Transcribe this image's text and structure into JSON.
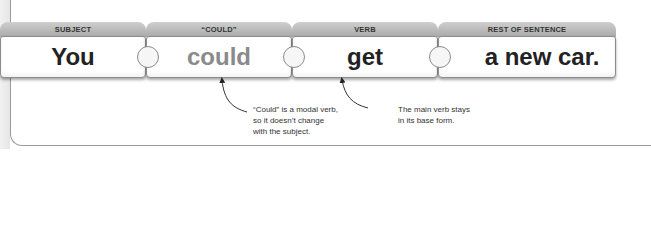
{
  "blocks": [
    {
      "header": "SUBJECT",
      "word": "You",
      "style": "normal"
    },
    {
      "header": "“COULD”",
      "word": "could",
      "style": "gray"
    },
    {
      "header": "VERB",
      "word": "get",
      "style": "normal"
    },
    {
      "header": "REST OF SENTENCE",
      "word": "a new car.",
      "style": "normal"
    }
  ],
  "annotations": [
    {
      "target": "could",
      "lines": [
        "“Could” is a modal verb,",
        "so it doesn’t change",
        "with the subject."
      ]
    },
    {
      "target": "get",
      "lines": [
        "The main verb stays",
        "in its base form."
      ]
    }
  ],
  "colors": {
    "header": "#b5b5b5",
    "modal_word": "#8a8a8a",
    "text": "#222222"
  }
}
